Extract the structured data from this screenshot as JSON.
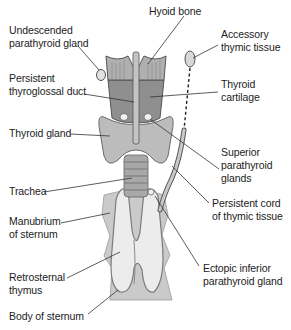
{
  "figure": {
    "colors": {
      "background": "#ffffff",
      "gland_fill": "#bdbdbd",
      "cartilage_fill": "#8f8f8f",
      "hyoid_fill": "#a9a9a9",
      "sternum_fill": "#c8c8c8",
      "thymus_fill": "#e6e6e6",
      "outline": "#555555",
      "leader_line": "#333333"
    }
  },
  "labels": {
    "hyoid_bone": "Hyoid bone",
    "undescended_parathyroid": "Undescended\nparathyroid gland",
    "accessory_thymic": "Accessory\nthymic tissue",
    "persistent_thyroglossal": "Persistent\nthyroglossal duct",
    "thyroid_cartilage": "Thyroid\ncartilage",
    "thyroid_gland": "Thyroid gland",
    "superior_parathyroid": "Superior\nparathyroid\nglands",
    "trachea": "Trachea",
    "persistent_cord": "Persistent cord\nof thymic tissue",
    "manubrium": "Manubrium\nof sternum",
    "retrosternal_thymus": "Retrosternal\nthymus",
    "ectopic_inferior": "Ectopic inferior\nparathyroid gland",
    "body_of_sternum": "Body of sternum"
  }
}
